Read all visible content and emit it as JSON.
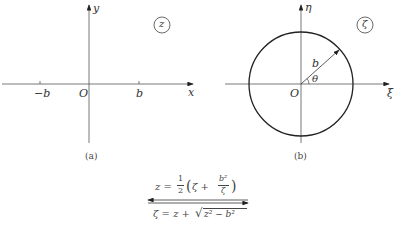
{
  "panel_a": {
    "caption": "(a)",
    "x_axis_label": "x",
    "y_axis_label": "y",
    "origin_label": "O",
    "tick_neg_label": "−b",
    "tick_pos_label": "b",
    "plane_label": "z"
  },
  "panel_b": {
    "caption": "(b)",
    "x_axis_label": "ξ",
    "y_axis_label": "η",
    "origin_label": "O",
    "radius_label": "b",
    "angle_label": "θ",
    "plane_label": "ζ"
  },
  "mapping": {
    "forward": "z = ½(ζ + b²/ζ)",
    "forward_lhs": "z =",
    "forward_half_num": "1",
    "forward_half_den": "2",
    "forward_paren_open": "(",
    "forward_zeta": "ζ +",
    "forward_frac_num": "b²",
    "forward_frac_den": "ζ",
    "forward_paren_close": ")",
    "inverse": "ζ = z + √(z² − b²)",
    "inverse_lhs": "ζ = z +",
    "inverse_radicand": "z² − b²"
  }
}
